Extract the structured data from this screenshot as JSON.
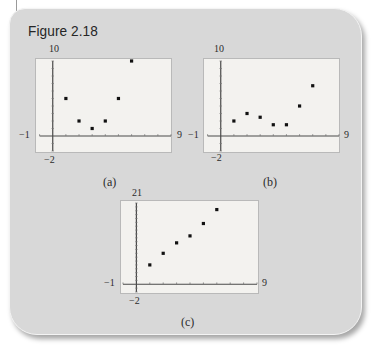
{
  "figure": {
    "title": "Figure 2.18"
  },
  "plots": [
    {
      "caption": "(a)",
      "labels": {
        "ymax": "10",
        "ymin": "−2",
        "xmin": "−1",
        "xmax": "9"
      }
    },
    {
      "caption": "(b)",
      "labels": {
        "ymax": "10",
        "ymin": "−2",
        "xmin": "−1",
        "xmax": "9"
      }
    },
    {
      "caption": "(c)",
      "labels": {
        "ymax": "21",
        "ymin": "−2",
        "xmin": "−1",
        "xmax": "9"
      }
    }
  ],
  "colors": {
    "panel": "#d8d8d8",
    "plot_bg": "#f3f2ef",
    "axis": "#4a4a4a",
    "point": "#111111"
  },
  "chart_data": [
    {
      "type": "scatter",
      "title": "(a)",
      "xlim": [
        -1,
        9
      ],
      "ylim": [
        -2,
        10
      ],
      "grid": false,
      "x": [
        1,
        2,
        3,
        4,
        5,
        6
      ],
      "y": [
        5,
        2,
        1,
        2,
        5,
        10
      ]
    },
    {
      "type": "scatter",
      "title": "(b)",
      "xlim": [
        -1,
        9
      ],
      "ylim": [
        -2,
        10
      ],
      "grid": false,
      "x": [
        1,
        2,
        3,
        4,
        5,
        6,
        7
      ],
      "y": [
        2,
        3,
        2.5,
        1.5,
        1.5,
        4,
        6.7
      ]
    },
    {
      "type": "scatter",
      "title": "(c)",
      "xlim": [
        -1,
        9
      ],
      "ylim": [
        -2,
        21
      ],
      "grid": false,
      "x": [
        1,
        2,
        3,
        4,
        5,
        6
      ],
      "y": [
        5,
        8,
        10.7,
        12.5,
        15.7,
        19.3
      ]
    }
  ]
}
